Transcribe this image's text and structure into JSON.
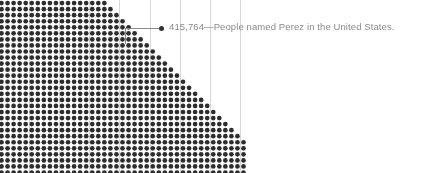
{
  "figure": {
    "width": 427,
    "height": 173,
    "background_color": "#ffffff"
  },
  "annotation": {
    "marker_name": "callout-dot",
    "value": "415,764",
    "separator": "—",
    "description": "People named Perez in the United States.",
    "full_text": "415,764—People named Perez in the United States.",
    "text_color": "#8a8a8a",
    "marker_color": "#333333",
    "leader_line_color": "#8a8a8a"
  },
  "chart_data": {
    "type": "scatter",
    "subtype": "dot-density-unit-chart",
    "title": "",
    "subtitle": "",
    "xlabel": "",
    "ylabel": "",
    "legend_position": "inline-callout",
    "grid": false,
    "dot_color": "#2d2d2d",
    "dot_radius_px": 2.35,
    "dot_spacing_x_px": 6.05,
    "dot_spacing_y_px": 6.05,
    "origin_x_px": 1.5,
    "origin_y_px": -9,
    "columns_total": 41,
    "rows_total": 31,
    "group_separator_every_columns": 5,
    "group_separator_color": "#d8d8d8",
    "annotated_value": 415764,
    "annotated_label": "People named Perez in the United States.",
    "shape_description": "Solid block of dots filling the left side; right boundary is a descending staircase so each successive row extends farther right.",
    "row_dot_counts": [
      16,
      17,
      18,
      19,
      20,
      21,
      22,
      23,
      24,
      25,
      26,
      27,
      28,
      29,
      30,
      31,
      32,
      33,
      34,
      35,
      36,
      37,
      38,
      39,
      40,
      41,
      41,
      41,
      41,
      41,
      41
    ],
    "series": [
      {
        "name": "People named Perez in the United States",
        "value": 415764,
        "unit_per_dot": 500,
        "color": "#2d2d2d"
      }
    ]
  }
}
